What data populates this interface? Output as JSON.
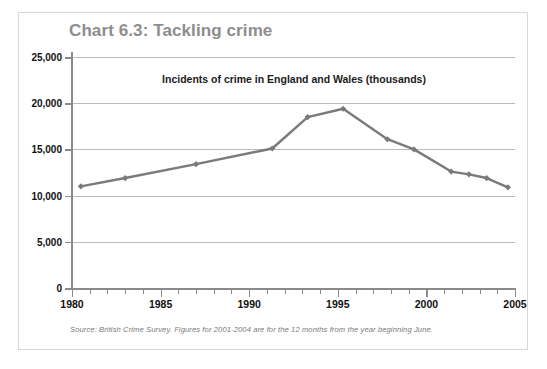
{
  "chart_data": {
    "type": "line",
    "title": "Chart 6.3: Tackling crime",
    "subtitle": "Incidents of crime in England and Wales (thousands)",
    "xlabel": "",
    "ylabel": "",
    "source": "Source: British Crime Survey. Figures for 2001-2004 are for the 12 months from the year beginning June.",
    "xlim": [
      1980,
      2005
    ],
    "ylim": [
      0,
      25000
    ],
    "grid": true,
    "legend": "none",
    "series_color": "#7a7a7a",
    "x_major_ticks": [
      "1980",
      "1985",
      "1990",
      "1995",
      "2000",
      "2005"
    ],
    "y_ticks": [
      "0",
      "5,000",
      "10,000",
      "15,000",
      "20,000",
      "25,000"
    ],
    "y_tick_values": [
      0,
      5000,
      10000,
      15000,
      20000,
      25000
    ],
    "series": [
      {
        "name": "Incidents of crime in England and Wales (thousands)",
        "x": [
          1980.5,
          1983.0,
          1987.0,
          1991.3,
          1993.3,
          1995.3,
          1997.8,
          1999.3,
          2001.4,
          2002.4,
          2003.4,
          2004.6
        ],
        "values": [
          11000,
          11900,
          13400,
          15100,
          18500,
          19400,
          16100,
          15000,
          12600,
          12300,
          11900,
          10900
        ]
      }
    ]
  },
  "figure": {
    "title": "Chart 6.3: Tackling crime",
    "subtitle": "Incidents of crime in England and Wales (thousands)",
    "source": "Source: British Crime Survey. Figures for 2001-2004 are for the 12 months from the year beginning June.",
    "title_color": "#8d8d8d",
    "line_color": "#7a7a7a",
    "grid_color": "#b9b9b9",
    "axis_color": "#8a8a8a",
    "border_color": "#d8d8d8",
    "background": "#ffffff"
  },
  "axes": {
    "y_labels": [
      "25,000",
      "20,000",
      "15,000",
      "10,000",
      "5,000",
      "0"
    ],
    "x_labels": [
      "1980",
      "1985",
      "1990",
      "1995",
      "2000",
      "2005"
    ]
  }
}
